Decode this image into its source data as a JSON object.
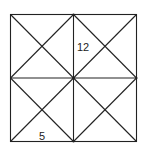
{
  "diagram": {
    "line_color": "#222222",
    "background": "#ffffff",
    "labels": [
      {
        "text": "12",
        "region": "top-right quadrant, left triangle near vertical midline"
      },
      {
        "text": "5",
        "region": "bottom-left quadrant, bottom triangle"
      }
    ]
  }
}
